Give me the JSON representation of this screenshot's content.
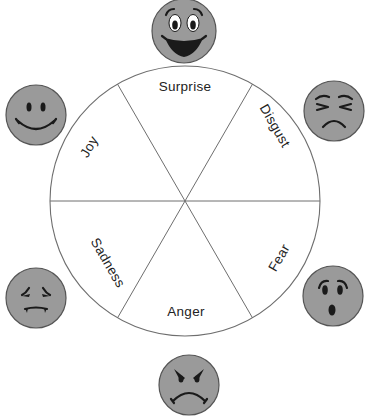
{
  "diagram": {
    "type": "emotion-wheel",
    "wheel": {
      "cx": 185,
      "cy": 201,
      "r": 135
    },
    "colors": {
      "face_fill": "#9a9a9a",
      "face_stroke": "#555555",
      "line": "#6e6e6e",
      "text": "#222222",
      "background": "#ffffff"
    },
    "sectors": [
      {
        "id": "surprise",
        "label": "Surprise",
        "face": "surprised-face"
      },
      {
        "id": "disgust",
        "label": "Disgust",
        "face": "disgusted-face"
      },
      {
        "id": "fear",
        "label": "Fear",
        "face": "fearful-face"
      },
      {
        "id": "anger",
        "label": "Anger",
        "face": "angry-face"
      },
      {
        "id": "sadness",
        "label": "Sadness",
        "face": "sad-face"
      },
      {
        "id": "joy",
        "label": "Joy",
        "face": "happy-face"
      }
    ]
  }
}
